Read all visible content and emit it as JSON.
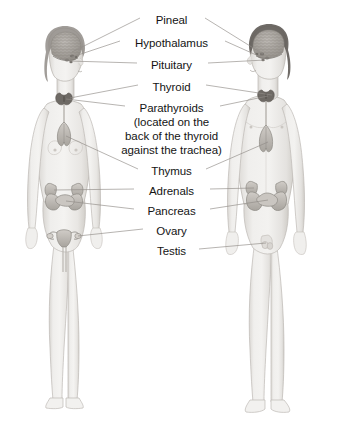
{
  "diagram": {
    "subjects": [
      {
        "name": "female-figure",
        "side": "left",
        "sex": "female"
      },
      {
        "name": "male-figure",
        "side": "right",
        "sex": "male"
      }
    ],
    "colors": {
      "background": "#ffffff",
      "text": "#141414",
      "leader_line": "#8a8a8a",
      "skin_light": "#f0efed",
      "skin_mid": "#e2e0dd",
      "skin_shadow": "#cfccc8",
      "outline": "#b4b0ab",
      "hair": "#8e8a85",
      "brain": "#a9a5a0",
      "organ_fill": "#c3bfba",
      "organ_dark": "#8a8680",
      "thyroid_dark": "#6e6a65"
    },
    "labels": [
      {
        "id": "pineal",
        "text": "Pineal",
        "y": 20,
        "lines_left": true,
        "lines_right": true
      },
      {
        "id": "hypothalamus",
        "text": "Hypothalamus",
        "y": 43,
        "lines_left": true,
        "lines_right": true
      },
      {
        "id": "pituitary",
        "text": "Pituitary",
        "y": 65,
        "lines_left": true,
        "lines_right": true
      },
      {
        "id": "thyroid",
        "text": "Thyroid",
        "y": 87,
        "lines_left": true,
        "lines_right": true
      },
      {
        "id": "parathyroids",
        "text": "Parathyroids",
        "y": 108,
        "lines_left": true,
        "lines_right": true
      },
      {
        "id": "parathyroids-note-1",
        "text": "(located on the",
        "y": 122,
        "lines_left": false,
        "lines_right": false
      },
      {
        "id": "parathyroids-note-2",
        "text": "back of the thyroid",
        "y": 136,
        "lines_left": false,
        "lines_right": false
      },
      {
        "id": "parathyroids-note-3",
        "text": "against the trachea)",
        "y": 150,
        "lines_left": false,
        "lines_right": false
      },
      {
        "id": "thymus",
        "text": "Thymus",
        "y": 171,
        "lines_left": true,
        "lines_right": true
      },
      {
        "id": "adrenals",
        "text": "Adrenals",
        "y": 191,
        "lines_left": true,
        "lines_right": true
      },
      {
        "id": "pancreas",
        "text": "Pancreas",
        "y": 211,
        "lines_left": true,
        "lines_right": true
      },
      {
        "id": "ovary",
        "text": "Ovary",
        "y": 231,
        "lines_left": true,
        "lines_right": false
      },
      {
        "id": "testis",
        "text": "Testis",
        "y": 251,
        "lines_left": false,
        "lines_right": true
      }
    ]
  }
}
